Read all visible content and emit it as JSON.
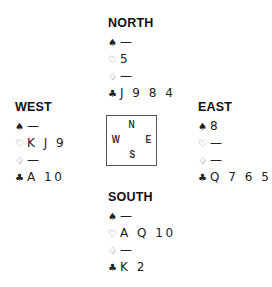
{
  "suits": {
    "spades": "♠",
    "hearts": "♡",
    "diamonds": "♢",
    "clubs": "♣"
  },
  "hands": {
    "north": {
      "title": "NORTH",
      "spades": "—",
      "hearts": "5",
      "diamonds": "—",
      "clubs": "J 9 8 4"
    },
    "west": {
      "title": "WEST",
      "spades": "—",
      "hearts": "K J 9",
      "diamonds": "—",
      "clubs": "A 10"
    },
    "east": {
      "title": "EAST",
      "spades": "8",
      "hearts": "—",
      "diamonds": "—",
      "clubs": "Q 7 6 5"
    },
    "south": {
      "title": "SOUTH",
      "spades": "—",
      "hearts": "A Q 10",
      "diamonds": "—",
      "clubs": "K 2"
    }
  },
  "compass": {
    "north": "N",
    "south": "S",
    "west": "W",
    "east": "E"
  }
}
